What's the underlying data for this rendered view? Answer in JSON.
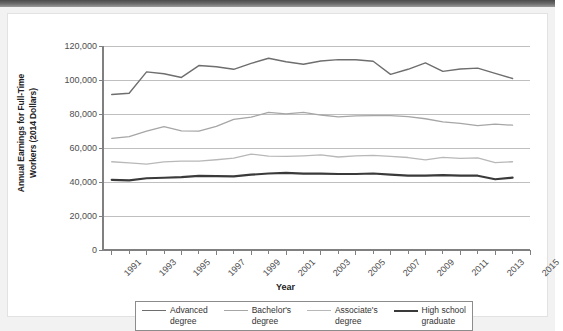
{
  "chart_data": {
    "type": "line",
    "title": "",
    "xlabel": "Year",
    "ylabel": "Annual Earnings for Full-Time Workers (2014 Dollars)",
    "ylim": [
      0,
      120000
    ],
    "xlim": [
      1990.5,
      2015
    ],
    "grid": "horizontal",
    "legend_position": "bottom",
    "x": [
      1991,
      1992,
      1993,
      1994,
      1995,
      1996,
      1997,
      1998,
      1999,
      2000,
      2001,
      2002,
      2003,
      2004,
      2005,
      2006,
      2007,
      2008,
      2009,
      2010,
      2011,
      2012,
      2013,
      2014
    ],
    "y_ticks": [
      "0",
      "20,000",
      "40,000",
      "60,000",
      "80,000",
      "100,000",
      "120,000"
    ],
    "y_tick_values": [
      0,
      20000,
      40000,
      60000,
      80000,
      100000,
      120000
    ],
    "x_ticks": [
      "1991",
      "1993",
      "1995",
      "1997",
      "1999",
      "2001",
      "2003",
      "2005",
      "2007",
      "2009",
      "2011",
      "2013",
      "2015"
    ],
    "x_tick_values": [
      1991,
      1993,
      1995,
      1997,
      1999,
      2001,
      2003,
      2005,
      2007,
      2009,
      2011,
      2013,
      2015
    ],
    "series": [
      {
        "name": "Advanced degree",
        "color": "#6e6e6e",
        "width": 1.4,
        "values": [
          91500,
          92200,
          104800,
          103700,
          101500,
          108500,
          107800,
          106300,
          109800,
          112800,
          110700,
          109300,
          111200,
          112000,
          111900,
          111000,
          103300,
          106300,
          110100,
          105100,
          106500,
          107000,
          103900,
          100900
        ]
      },
      {
        "name": "Bachelor's degree",
        "color": "#a6a6a6",
        "width": 1.3,
        "values": [
          65700,
          66700,
          69900,
          72600,
          70100,
          69900,
          72700,
          76800,
          78100,
          81000,
          80100,
          80900,
          79400,
          78300,
          78900,
          79100,
          79000,
          78500,
          77200,
          75400,
          74500,
          73200,
          74000,
          73400
        ]
      },
      {
        "name": "Associate's degree",
        "color": "#b8b8b8",
        "width": 1.3,
        "values": [
          51900,
          51200,
          50500,
          51800,
          52300,
          52300,
          53100,
          54100,
          56400,
          55200,
          55100,
          55400,
          55900,
          54700,
          55400,
          55700,
          55100,
          54400,
          53000,
          54500,
          53900,
          54200,
          51400,
          51900
        ]
      },
      {
        "name": "High school graduate",
        "color": "#3a3a3a",
        "width": 2.2,
        "values": [
          41300,
          41000,
          42200,
          42500,
          42900,
          43600,
          43500,
          43300,
          44300,
          45000,
          45400,
          44900,
          44900,
          44700,
          44700,
          45000,
          44300,
          43800,
          43700,
          44000,
          43800,
          43700,
          41600,
          42600
        ]
      }
    ]
  },
  "axis": {
    "y_title": "Annual Earnings for Full-Time\nWorkers (2014 Dollars)",
    "y_title_line1": "Annual Earnings for Full-Time",
    "y_title_line2": "Workers (2014 Dollars)",
    "x_title": "Year"
  },
  "legend": {
    "items": [
      {
        "label": "Advanced\ndegree",
        "color": "#6e6e6e",
        "width": 1.6
      },
      {
        "label": "Bachelor's\ndegree",
        "color": "#a6a6a6",
        "width": 1.4
      },
      {
        "label": "Associate's\ndegree",
        "color": "#b8b8b8",
        "width": 1.4
      },
      {
        "label": "High school\ngraduate",
        "color": "#3a3a3a",
        "width": 2.4
      }
    ]
  },
  "colors": {
    "chrome_bar": "#5a5a5a",
    "page_background": "#f2f2f2",
    "figure_background": "#ffffff",
    "gridline": "#bfbfbf",
    "axis": "#808080",
    "tick_text": "#4d4d4d"
  }
}
